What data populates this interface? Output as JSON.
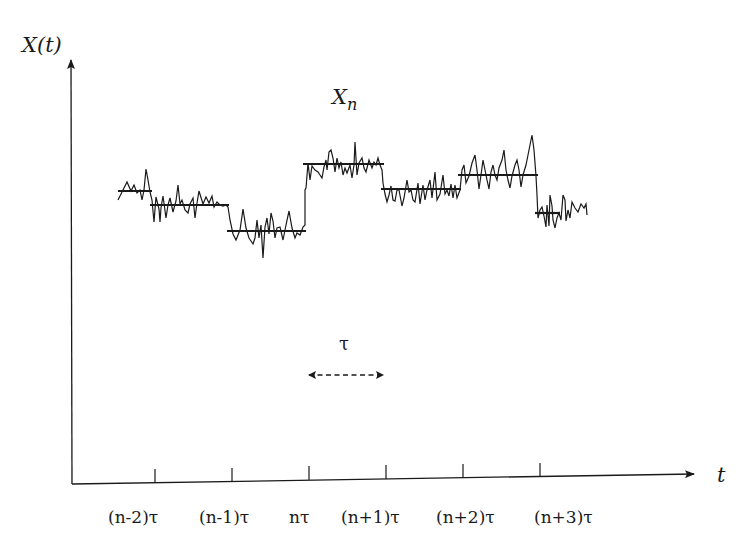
{
  "figure": {
    "y_axis_label": "X(t)",
    "x_axis_label": "t",
    "level_label": "X",
    "level_label_subscript": "n",
    "interval_label": "τ",
    "tick_labels": [
      "(n-2)τ",
      "(n-1)τ",
      "nτ",
      "(n+1)τ",
      "(n+2)τ",
      "(n+3)τ"
    ],
    "colors": {
      "ink": "#1a1a1a",
      "background": "#ffffff"
    },
    "segments": [
      {
        "interval": "start–(n-2)τ",
        "x0": 118,
        "x1": 152,
        "level_y": 191
      },
      {
        "interval": "(n-2)τ–(n-1)τ",
        "x0": 150,
        "x1": 229,
        "level_y": 205
      },
      {
        "interval": "(n-1)τ–nτ",
        "x0": 227,
        "x1": 306,
        "level_y": 231
      },
      {
        "interval": "nτ–(n+1)τ",
        "x0": 303,
        "x1": 384,
        "level_y": 164
      },
      {
        "interval": "(n+1)τ–(n+2)τ",
        "x0": 381,
        "x1": 461,
        "level_y": 189
      },
      {
        "interval": "(n+2)τ–(n+3)τ",
        "x0": 458,
        "x1": 538,
        "level_y": 175
      },
      {
        "interval": "(n+3)τ–end",
        "x0": 535,
        "x1": 560,
        "level_y": 213
      }
    ]
  }
}
